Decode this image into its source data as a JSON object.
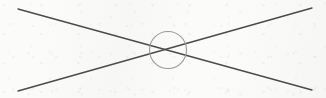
{
  "figure": {
    "medium": "scanned line drawing on off-white paper",
    "canvas": {
      "width": 326,
      "height": 98,
      "background_color": "#fbfbfa"
    },
    "strokes": {
      "line_color": "#4a4a4a",
      "line_width": 1.3,
      "circle_color": "#9a9a9a",
      "circle_width": 1.1
    },
    "elements": [
      {
        "id": "line-descending",
        "name": "diagonal line top-left to bottom-right",
        "type": "line",
        "x1": 18,
        "y1": 9,
        "x2": 312,
        "y2": 90,
        "color": "#4a4a4a",
        "width": 1.3
      },
      {
        "id": "line-ascending",
        "name": "diagonal line bottom-left to top-right",
        "type": "line",
        "x1": 18,
        "y1": 91,
        "x2": 312,
        "y2": 8,
        "color": "#4a4a4a",
        "width": 1.3
      },
      {
        "id": "intersection-circle",
        "name": "circle annotation marking the crossing point",
        "type": "circle",
        "cx": 168,
        "cy": 50,
        "r": 18.5,
        "color": "#9a9a9a",
        "width": 1.1,
        "fill": "none"
      }
    ],
    "intersection_point": {
      "x": 166,
      "y": 50,
      "label": ""
    },
    "labels": [],
    "text": []
  }
}
